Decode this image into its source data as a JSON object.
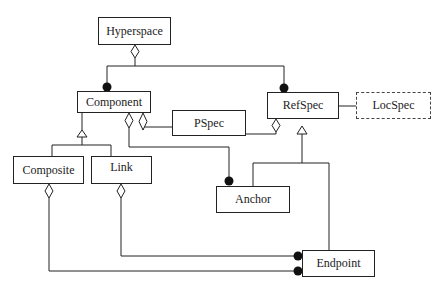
{
  "diagram": {
    "type": "uml-class-diagram",
    "nodes": [
      {
        "id": "hyperspace",
        "label": "Hyperspace",
        "style": "solid"
      },
      {
        "id": "component",
        "label": "Component",
        "style": "solid"
      },
      {
        "id": "pspec",
        "label": "PSpec",
        "style": "solid"
      },
      {
        "id": "refspec",
        "label": "RefSpec",
        "style": "solid"
      },
      {
        "id": "locspec",
        "label": "LocSpec",
        "style": "dashed"
      },
      {
        "id": "composite",
        "label": "Composite",
        "style": "solid"
      },
      {
        "id": "link",
        "label": "Link",
        "style": "solid"
      },
      {
        "id": "anchor",
        "label": "Anchor",
        "style": "solid"
      },
      {
        "id": "endpoint",
        "label": "Endpoint",
        "style": "solid"
      }
    ],
    "edges": [
      {
        "from": "hyperspace",
        "to": "component",
        "type": "aggregation"
      },
      {
        "from": "hyperspace",
        "to": "refspec",
        "type": "aggregation"
      },
      {
        "from": "composite",
        "to": "component",
        "type": "generalization"
      },
      {
        "from": "link",
        "to": "component",
        "type": "generalization"
      },
      {
        "from": "component",
        "to": "pspec",
        "type": "aggregation"
      },
      {
        "from": "component",
        "to": "anchor",
        "type": "aggregation"
      },
      {
        "from": "refspec",
        "to": "pspec",
        "type": "aggregation"
      },
      {
        "from": "anchor",
        "to": "refspec",
        "type": "generalization"
      },
      {
        "from": "endpoint",
        "to": "refspec",
        "type": "generalization"
      },
      {
        "from": "refspec",
        "to": "locspec",
        "type": "association"
      },
      {
        "from": "link",
        "to": "endpoint",
        "type": "aggregation"
      },
      {
        "from": "composite",
        "to": "endpoint",
        "type": "aggregation"
      }
    ]
  }
}
